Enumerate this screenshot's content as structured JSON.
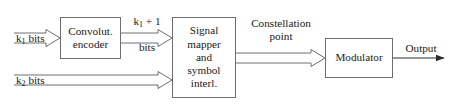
{
  "diagram": {
    "background_color": "#ffffff",
    "line_color": "#6e6e6e",
    "text_color": "#1a1a1a",
    "nodes": [
      {
        "id": "encoder",
        "label": "Convolut.\nencoder",
        "shape": "rectangle"
      },
      {
        "id": "mapper",
        "label": "Signal\nmapper\nand\nsymbol\ninterl.",
        "shape": "rectangle"
      },
      {
        "id": "modulator",
        "label": "Modulator",
        "shape": "rectangle"
      }
    ],
    "edge_labels": {
      "k1_bits": {
        "base": "k",
        "subscript": "1",
        "rest": " bits"
      },
      "k2_bits": {
        "base": "k",
        "subscript": "2",
        "rest": " bits"
      },
      "k1_plus_1_bits": {
        "base": "k",
        "subscript": "1",
        "rest": " + 1",
        "line2": "bits"
      },
      "constellation_point": "Constellation\npoint",
      "output": "Output"
    },
    "connections": [
      {
        "from": "k1_bits_input",
        "to": "encoder",
        "style": "double-line-open-arrow"
      },
      {
        "from": "encoder",
        "to": "mapper",
        "style": "double-line-open-arrow",
        "label": "k1_plus_1_bits"
      },
      {
        "from": "k2_bits_input",
        "to": "mapper",
        "style": "double-line-open-arrow",
        "label": "k2_bits"
      },
      {
        "from": "mapper",
        "to": "modulator",
        "style": "double-line-open-arrow",
        "label": "constellation_point"
      },
      {
        "from": "modulator",
        "to": "output",
        "style": "single-line-solid-arrow",
        "label": "output"
      }
    ]
  }
}
